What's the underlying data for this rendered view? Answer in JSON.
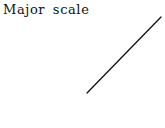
{
  "title": "Major scale",
  "line": {
    "x1": 87,
    "y1": 93,
    "x2": 161,
    "y2": 17,
    "color": "#111111",
    "width": 1.3
  }
}
